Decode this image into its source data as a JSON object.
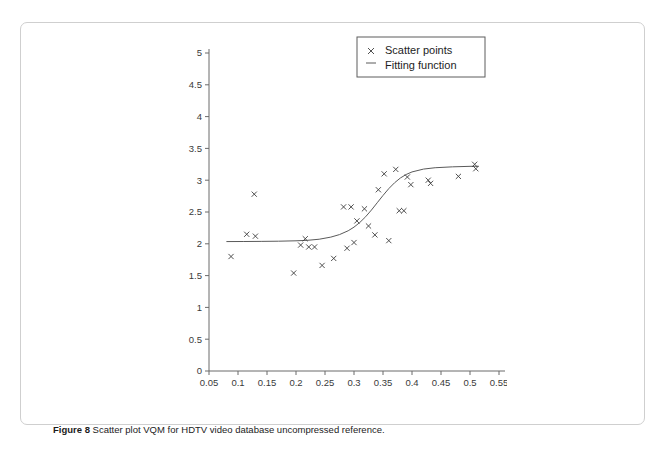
{
  "caption": {
    "label": "Figure 8",
    "text": "Scatter plot VQM for HDTV video database uncompressed reference."
  },
  "legend": {
    "scatter_label": "Scatter points",
    "fit_label": "Fitting function",
    "scatter_marker": "x-marker-icon",
    "fit_marker": "line-marker-icon"
  },
  "chart_data": {
    "type": "scatter",
    "title": "",
    "xlabel": "VQM",
    "ylabel": "DMOS",
    "xlim": [
      0.05,
      0.55
    ],
    "ylim": [
      0,
      5
    ],
    "xticks": [
      "0.05",
      "0.1",
      "0.15",
      "0.2",
      "0.25",
      "0.3",
      "0.35",
      "0.4",
      "0.45",
      "0.5",
      "0.55"
    ],
    "xtick_values": [
      0.05,
      0.1,
      0.15,
      0.2,
      0.25,
      0.3,
      0.35,
      0.4,
      0.45,
      0.5,
      0.55
    ],
    "yticks": [
      "0",
      "0.5",
      "1",
      "1.5",
      "2",
      "2.5",
      "3",
      "3.5",
      "4",
      "4.5",
      "5"
    ],
    "ytick_values": [
      0,
      0.5,
      1,
      1.5,
      2,
      2.5,
      3,
      3.5,
      4,
      4.5,
      5
    ],
    "grid": false,
    "legend_position": "top-right",
    "series": [
      {
        "name": "Scatter points",
        "marker": "x",
        "points": [
          [
            0.088,
            1.8
          ],
          [
            0.115,
            2.15
          ],
          [
            0.128,
            2.78
          ],
          [
            0.13,
            2.12
          ],
          [
            0.196,
            1.54
          ],
          [
            0.208,
            1.98
          ],
          [
            0.216,
            2.08
          ],
          [
            0.222,
            1.95
          ],
          [
            0.232,
            1.95
          ],
          [
            0.245,
            1.66
          ],
          [
            0.265,
            1.77
          ],
          [
            0.282,
            2.58
          ],
          [
            0.288,
            1.93
          ],
          [
            0.295,
            2.58
          ],
          [
            0.3,
            2.02
          ],
          [
            0.305,
            2.36
          ],
          [
            0.318,
            2.55
          ],
          [
            0.325,
            2.28
          ],
          [
            0.336,
            2.14
          ],
          [
            0.342,
            2.85
          ],
          [
            0.352,
            3.1
          ],
          [
            0.36,
            2.05
          ],
          [
            0.372,
            3.17
          ],
          [
            0.378,
            2.52
          ],
          [
            0.386,
            2.52
          ],
          [
            0.392,
            3.05
          ],
          [
            0.398,
            2.93
          ],
          [
            0.428,
            3.0
          ],
          [
            0.432,
            2.95
          ],
          [
            0.48,
            3.06
          ],
          [
            0.508,
            3.25
          ],
          [
            0.51,
            3.18
          ]
        ]
      },
      {
        "name": "Fitting function",
        "type": "line",
        "description": "logistic sigmoid fit",
        "points": [
          [
            0.08,
            2.035
          ],
          [
            0.11,
            2.036
          ],
          [
            0.14,
            2.038
          ],
          [
            0.17,
            2.041
          ],
          [
            0.2,
            2.047
          ],
          [
            0.22,
            2.055
          ],
          [
            0.24,
            2.072
          ],
          [
            0.26,
            2.105
          ],
          [
            0.275,
            2.145
          ],
          [
            0.29,
            2.205
          ],
          [
            0.3,
            2.262
          ],
          [
            0.31,
            2.335
          ],
          [
            0.32,
            2.425
          ],
          [
            0.33,
            2.53
          ],
          [
            0.34,
            2.645
          ],
          [
            0.35,
            2.76
          ],
          [
            0.36,
            2.868
          ],
          [
            0.37,
            2.96
          ],
          [
            0.38,
            3.035
          ],
          [
            0.39,
            3.09
          ],
          [
            0.4,
            3.13
          ],
          [
            0.42,
            3.175
          ],
          [
            0.44,
            3.196
          ],
          [
            0.47,
            3.21
          ],
          [
            0.5,
            3.218
          ],
          [
            0.515,
            3.22
          ]
        ]
      }
    ]
  }
}
